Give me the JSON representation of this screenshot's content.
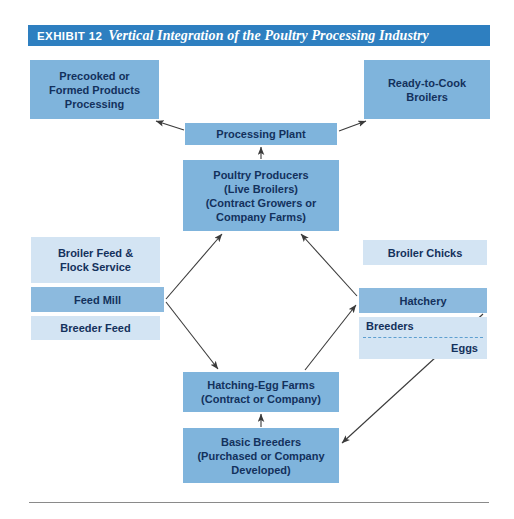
{
  "header": {
    "exhibit_label": "EXHIBIT 12",
    "title": "Vertical Integration of the Poultry Processing Industry",
    "bar_color": "#2e7fc0",
    "text_color": "#ffffff"
  },
  "palette": {
    "box_mid": "#7fb4dc",
    "box_light": "#d3e4f3",
    "box_deep": "#8cbade",
    "box_text": "#13315c",
    "arrow": "#3a3a3a",
    "rule": "#8a8a8a"
  },
  "nodes": {
    "precooked": {
      "name": "Precooked or Formed Products Processing",
      "lines": [
        "Precooked or",
        "Formed Products",
        "Processing"
      ]
    },
    "ready_to_cook": {
      "name": "Ready-to-Cook Broilers",
      "lines": [
        "Ready-to-Cook",
        "Broilers"
      ]
    },
    "processing_plant": {
      "name": "Processing Plant",
      "lines": [
        "Processing Plant"
      ]
    },
    "poultry_producers": {
      "name": "Poultry Producers",
      "lines": [
        "Poultry Producers",
        "(Live Broilers)",
        "(Contract Growers or",
        "Company Farms)"
      ]
    },
    "broiler_feed": {
      "name": "Broiler Feed & Flock Service",
      "lines": [
        "Broiler Feed &",
        "Flock Service"
      ]
    },
    "feed_mill": {
      "name": "Feed Mill",
      "lines": [
        "Feed Mill"
      ]
    },
    "breeder_feed": {
      "name": "Breeder Feed",
      "lines": [
        "Breeder Feed"
      ]
    },
    "broiler_chicks": {
      "name": "Broiler Chicks",
      "lines": [
        "Broiler Chicks"
      ]
    },
    "hatchery": {
      "name": "Hatchery",
      "lines": [
        "Hatchery"
      ]
    },
    "breeders_eggs": {
      "name": "Breeders and Eggs",
      "top_label": "Breeders",
      "bottom_label": "Eggs"
    },
    "hatching_egg_farms": {
      "name": "Hatching-Egg Farms",
      "lines": [
        "Hatching-Egg Farms",
        "(Contract or Company)"
      ]
    },
    "basic_breeders": {
      "name": "Basic Breeders",
      "lines": [
        "Basic Breeders",
        "(Purchased or Company",
        "Developed)"
      ]
    }
  },
  "edges": [
    {
      "from": "processing_plant",
      "to": "precooked",
      "style": "arrow"
    },
    {
      "from": "processing_plant",
      "to": "ready_to_cook",
      "style": "arrow"
    },
    {
      "from": "poultry_producers",
      "to": "processing_plant",
      "style": "arrow"
    },
    {
      "from": "feed_mill",
      "to": "poultry_producers",
      "style": "arrow"
    },
    {
      "from": "feed_mill",
      "to": "hatching_egg_farms",
      "style": "arrow"
    },
    {
      "from": "hatchery",
      "to": "poultry_producers",
      "style": "arrow"
    },
    {
      "from": "hatching_egg_farms",
      "to": "hatchery",
      "style": "arrow"
    },
    {
      "from": "basic_breeders",
      "to": "hatching_egg_farms",
      "style": "arrow"
    },
    {
      "from": "hatchery",
      "to": "basic_breeders",
      "style": "arrow"
    }
  ]
}
